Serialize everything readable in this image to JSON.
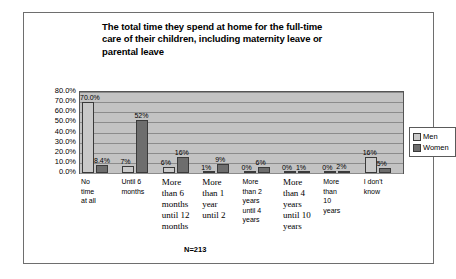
{
  "chart_data": {
    "type": "bar",
    "title": "The total time they spend at home for the full-time care of their children, including maternity leave or parental leave",
    "title_lines": [
      "The total time they spend at home for the full-time",
      "care of their children, including maternity leave or",
      "parental leave"
    ],
    "categories": [
      "No time at all",
      "Until 6 months",
      "More than 6 months until 12 months",
      "More than 1 year until 2",
      "More than 2 years until 4 years",
      "More than 4 years until 10 years",
      "More than 10 years",
      "I don't know"
    ],
    "category_lines": [
      [
        "No",
        "time",
        "at all"
      ],
      [
        "Until 6",
        "months"
      ],
      [
        "More",
        "than 6",
        "months",
        "until 12",
        "months"
      ],
      [
        "More",
        "than 1",
        "year",
        "until 2"
      ],
      [
        "More",
        "than 2",
        "years",
        "until 4",
        "years"
      ],
      [
        "More",
        "than 4",
        "years",
        "until 10",
        "years"
      ],
      [
        "More",
        "than",
        "10",
        "years"
      ],
      [
        "I don't",
        "know"
      ]
    ],
    "series": [
      {
        "name": "Men",
        "color": "#c9c9c9",
        "values": [
          70.0,
          7,
          6,
          1,
          0,
          0,
          0,
          16
        ],
        "labels": [
          "70.0%",
          "7%",
          "6%",
          "1%",
          "0%",
          "0%",
          "0%",
          "16%"
        ]
      },
      {
        "name": "Women",
        "color": "#6d6d6d",
        "values": [
          8.4,
          52,
          16,
          9,
          6,
          1,
          2,
          5
        ],
        "labels": [
          "8.4%",
          "52%",
          "16%",
          "9%",
          "6%",
          "1%",
          "2%",
          "5%"
        ]
      }
    ],
    "ylim": [
      0,
      80
    ],
    "ytick_labels": [
      "80.0%",
      "70.0%",
      "60.0%",
      "50.0%",
      "40.0%",
      "30.0%",
      "20.0%",
      "10.0%",
      "0.0%"
    ],
    "ytick_values": [
      80,
      70,
      60,
      50,
      40,
      30,
      20,
      10,
      0
    ],
    "xlabel": "",
    "ylabel": "",
    "grid": true,
    "legend_position": "right",
    "annotation": "N=213",
    "plot_background": "#c3c3c3"
  }
}
